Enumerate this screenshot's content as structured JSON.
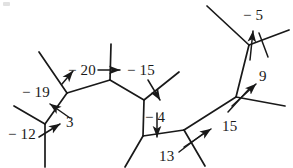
{
  "figure": {
    "width": 293,
    "height": 168,
    "background_color": "#ffffff",
    "ink_color": "#191919",
    "stroke_width": 1.6
  },
  "labels": [
    {
      "id": "m5",
      "text": "− 5",
      "x": 243,
      "y": 8,
      "name": "edge-label-minus-5"
    },
    {
      "id": "m20",
      "text": "− 20",
      "x": 68,
      "y": 63,
      "name": "edge-label-minus-20"
    },
    {
      "id": "m15",
      "text": "− 15",
      "x": 127,
      "y": 63,
      "name": "edge-label-minus-15"
    },
    {
      "id": "m19",
      "text": "− 19",
      "x": 22,
      "y": 85,
      "name": "edge-label-minus-19"
    },
    {
      "id": "n9",
      "text": "9",
      "x": 259,
      "y": 69,
      "name": "edge-label-9"
    },
    {
      "id": "m4",
      "text": "− 4",
      "x": 145,
      "y": 110,
      "name": "edge-label-minus-4"
    },
    {
      "id": "n3",
      "text": "3",
      "x": 66,
      "y": 115,
      "name": "edge-label-3"
    },
    {
      "id": "n15",
      "text": "15",
      "x": 222,
      "y": 119,
      "name": "edge-label-15"
    },
    {
      "id": "m12",
      "text": "− 12",
      "x": 8,
      "y": 127,
      "name": "edge-label-minus-12"
    },
    {
      "id": "n13",
      "text": "13",
      "x": 159,
      "y": 149,
      "name": "edge-label-13"
    }
  ],
  "graph": {
    "vertices": [
      {
        "id": "A",
        "x": 45,
        "y": 124,
        "name": "vertex-a"
      },
      {
        "id": "B",
        "x": 67,
        "y": 93,
        "name": "vertex-b"
      },
      {
        "id": "C",
        "x": 110,
        "y": 80,
        "name": "vertex-c"
      },
      {
        "id": "D",
        "x": 144,
        "y": 100,
        "name": "vertex-d"
      },
      {
        "id": "E",
        "x": 143,
        "y": 136,
        "name": "vertex-e"
      },
      {
        "id": "F",
        "x": 184,
        "y": 130,
        "name": "vertex-f"
      },
      {
        "id": "G",
        "x": 236,
        "y": 97,
        "name": "vertex-g"
      },
      {
        "id": "H",
        "x": 249,
        "y": 45,
        "name": "vertex-h"
      }
    ],
    "internal_edges": [
      {
        "from": "A",
        "to": "B",
        "name": "edge-a-b"
      },
      {
        "from": "B",
        "to": "C",
        "name": "edge-b-c"
      },
      {
        "from": "C",
        "to": "D",
        "name": "edge-c-d"
      },
      {
        "from": "D",
        "to": "E",
        "name": "edge-d-e"
      },
      {
        "from": "E",
        "to": "F",
        "name": "edge-e-f"
      },
      {
        "from": "F",
        "to": "G",
        "name": "edge-f-g"
      },
      {
        "from": "G",
        "to": "H",
        "name": "edge-g-h"
      }
    ],
    "leaf_edges": [
      {
        "from": "A",
        "x2": 14,
        "y2": 106,
        "name": "leaf-edge-a-upper-left"
      },
      {
        "from": "A",
        "x2": 45,
        "y2": 167,
        "name": "leaf-edge-a-down"
      },
      {
        "from": "B",
        "x2": 39,
        "y2": 52,
        "name": "leaf-edge-b-upper-left"
      },
      {
        "from": "C",
        "x2": 111,
        "y2": 44,
        "name": "leaf-edge-c-up"
      },
      {
        "from": "D",
        "x2": 179,
        "y2": 72,
        "name": "leaf-edge-d-upper-right"
      },
      {
        "from": "E",
        "x2": 125,
        "y2": 167,
        "name": "leaf-edge-e-down-left"
      },
      {
        "from": "F",
        "x2": 205,
        "y2": 166,
        "name": "leaf-edge-f-down-right"
      },
      {
        "from": "G",
        "x2": 285,
        "y2": 106,
        "name": "leaf-edge-g-right"
      },
      {
        "from": "H",
        "x2": 207,
        "y2": 6,
        "name": "leaf-edge-h-upper-left"
      },
      {
        "from": "H",
        "x2": 289,
        "y2": 30,
        "name": "leaf-edge-h-upper-right"
      }
    ],
    "tick_marks": [
      {
        "x1": 259,
        "y1": 33,
        "x2": 268,
        "y2": 57,
        "name": "tick-mark-h"
      },
      {
        "x1": 228,
        "y1": 112,
        "x2": 249,
        "y2": 89,
        "name": "tick-mark-g"
      },
      {
        "x1": 179,
        "y1": 152,
        "x2": 204,
        "y2": 133,
        "name": "tick-mark-f"
      }
    ],
    "pointer_arrows": [
      {
        "x1": 39,
        "y1": 137,
        "x2": 60,
        "y2": 124,
        "name": "arrow-minus-12"
      },
      {
        "x1": 70,
        "y1": 118,
        "x2": 50,
        "y2": 104,
        "name": "arrow-3"
      },
      {
        "x1": 62,
        "y1": 84,
        "x2": 73,
        "y2": 71,
        "name": "arrow-minus-20-to-edge"
      },
      {
        "x1": 98,
        "y1": 70,
        "x2": 120,
        "y2": 70,
        "name": "arrow-minus-20-minus-15"
      },
      {
        "x1": 148,
        "y1": 80,
        "x2": 160,
        "y2": 100,
        "name": "arrow-minus-15-pointer"
      },
      {
        "x1": 157,
        "y1": 113,
        "x2": 157,
        "y2": 137,
        "name": "arrow-minus-4"
      },
      {
        "x1": 184,
        "y1": 147,
        "x2": 211,
        "y2": 129,
        "name": "arrow-15"
      },
      {
        "x1": 232,
        "y1": 106,
        "x2": 256,
        "y2": 84,
        "name": "arrow-9"
      },
      {
        "x1": 250,
        "y1": 60,
        "x2": 253,
        "y2": 31,
        "name": "arrow-minus-5"
      }
    ]
  },
  "artifact": {
    "x": 3,
    "y": 2,
    "name": "scan-speck"
  }
}
